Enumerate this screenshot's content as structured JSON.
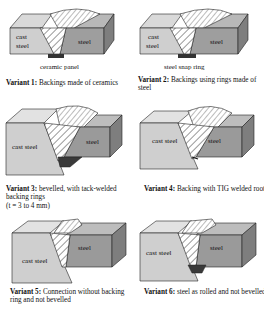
{
  "colors": {
    "cast_steel_front": "#cfcfcf",
    "cast_steel_top": "#e2e2e2",
    "steel_front": "#9a9a9a",
    "steel_top": "#bdbdbd",
    "steel_side": "#7e7e7e",
    "weld_hatch_bg": "#ffffff",
    "backing": "#3a3a3a",
    "outline": "#222222"
  },
  "variants": [
    {
      "id": 1,
      "title": "Variant 1:",
      "description": "Backings made of ceramics",
      "labels": {
        "left": [
          "cast",
          "steel"
        ],
        "right": "steel"
      },
      "sublabel": "ceramic panel"
    },
    {
      "id": 2,
      "title": "Variant 2:",
      "description": "Backings using rings made of steel",
      "labels": {
        "left": [
          "cast",
          "steel"
        ],
        "right": "steel"
      },
      "sublabel": "steel snap ring"
    },
    {
      "id": 3,
      "title": "Variant 3:",
      "description": "bevelled, with tack-welded backing rings",
      "description_2": "(t = 3 to 4 mm)",
      "labels": {
        "left": "cast steel",
        "right": "steel"
      }
    },
    {
      "id": 4,
      "title": "Variant 4:",
      "description": "Backing with TIG welded root",
      "labels": {
        "left": "cast steel",
        "right": "steel"
      }
    },
    {
      "id": 5,
      "title": "Variant 5:",
      "description": "Connection without backing ring and not bevelled",
      "labels": {
        "left": "cast steel",
        "right": "steel"
      }
    },
    {
      "id": 6,
      "title": "Variant 6:",
      "description": "steel as rolled and not bevelled",
      "labels": {
        "left": "cast steel",
        "right": "steel"
      }
    }
  ]
}
